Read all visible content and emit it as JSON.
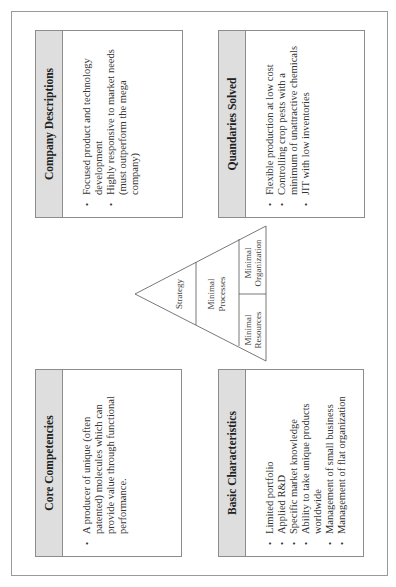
{
  "diagram": {
    "boxes": {
      "core_competencies": {
        "title": "Core Competencies",
        "items": [
          "A producer of unique (often patented) molecules which can provide value through functional performance."
        ]
      },
      "basic_characteristics": {
        "title": "Basic Characteristics",
        "items": [
          "Limited portfolio",
          "Applied R&D",
          "Specific market knowledge",
          "Ability to take unique products worldwide",
          "Management of small business",
          "Management of flat organization"
        ]
      },
      "company_descriptions": {
        "title": "Company Descriptions",
        "items": [
          "Focused product and technology development",
          "Highly responsive to market needs (must outperform the mega company)"
        ]
      },
      "quandaries_solved": {
        "title": "Quandaries Solved",
        "items": [
          "Flexible production at low cost",
          "Controlling crop pests with a minimum of unattractive chemicals",
          "JIT with low inventories"
        ]
      }
    },
    "pyramid": {
      "apex_label": "Strategy",
      "middle_label_line1": "Minimal",
      "middle_label_line2": "Processes",
      "base_left_line1": "Minimal",
      "base_left_line2": "Resources",
      "base_right_line1": "Minimal",
      "base_right_line2": "Organization"
    },
    "orientation": "rotated 90° counter-clockwise",
    "colors": {
      "header_fill": "#dedede",
      "border": "#8c8c8c",
      "text": "#333333"
    }
  }
}
